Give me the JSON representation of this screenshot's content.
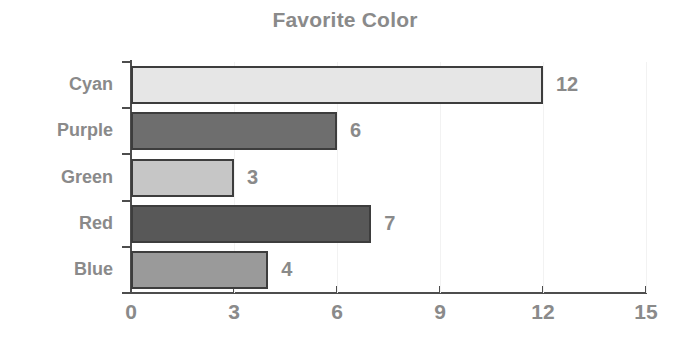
{
  "chart_data": {
    "type": "bar",
    "orientation": "horizontal",
    "title": "Favorite Color",
    "xlabel": "",
    "ylabel": "",
    "categories": [
      "Cyan",
      "Purple",
      "Green",
      "Red",
      "Blue"
    ],
    "values": [
      12,
      6,
      3,
      7,
      4
    ],
    "bar_colors": [
      "#e6e6e6",
      "#6e6e6e",
      "#c6c6c6",
      "#585858",
      "#9a9a9a"
    ],
    "bar_edge_color": "#3d3d3d",
    "value_labels": [
      "12",
      "6",
      "3",
      "7",
      "4"
    ],
    "xlim": [
      0,
      15
    ],
    "xticks": [
      0,
      3,
      6,
      9,
      12,
      15
    ],
    "xtick_labels": [
      "0",
      "3",
      "6",
      "9",
      "12",
      "15"
    ],
    "grid": "light-vertical",
    "legend": "none",
    "title_color": "#8a8a8a",
    "tick_label_color": "#8a8a8a",
    "axis_color": "#4d4d4d",
    "background": "#ffffff"
  }
}
